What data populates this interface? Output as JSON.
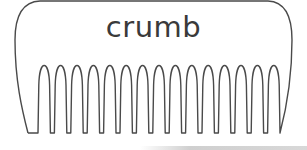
{
  "card": {
    "word": "crumb",
    "illustration": "comb",
    "teeth_count": 15,
    "stroke_color": "#4a4a4a",
    "text_color": "#3a3a3a"
  }
}
